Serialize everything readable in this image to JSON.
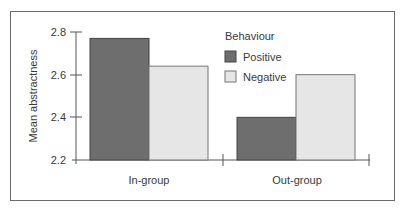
{
  "chart_data": {
    "type": "bar",
    "title": "",
    "xlabel": "",
    "ylabel": "Mean abstractness",
    "ylim": [
      2.2,
      2.8
    ],
    "yticks": [
      2.2,
      2.4,
      2.6,
      2.8
    ],
    "categories": [
      "In-group",
      "Out-group"
    ],
    "legend_title": "Behaviour",
    "legend_position": "upper right",
    "grid": false,
    "series": [
      {
        "name": "Positive",
        "color": "#6e6e6e",
        "values": [
          2.77,
          2.4
        ]
      },
      {
        "name": "Negative",
        "color": "#e6e6e6",
        "values": [
          2.64,
          2.6
        ]
      }
    ]
  },
  "labels": {
    "ylabel": "Mean abstractness",
    "yticks": [
      "2.8",
      "2.6",
      "2.4",
      "2.2"
    ],
    "categories": [
      "In-group",
      "Out-group"
    ],
    "legend_title": "Behaviour",
    "legend_items": [
      "Positive",
      "Negative"
    ]
  }
}
